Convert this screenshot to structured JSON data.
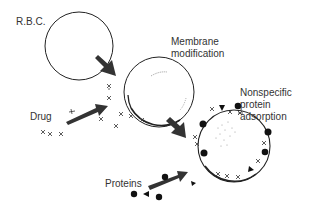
{
  "diagram": {
    "labels": {
      "rbc": "R.B.C.",
      "membrane_line1": "Membrane",
      "membrane_line2": "modification",
      "nonspecific_line1": "Nonspecific",
      "nonspecific_line2": "protein",
      "nonspecific_line3": "adsorption",
      "drug": "Drug",
      "proteins": "Proteins"
    },
    "stages": [
      {
        "name": "rbc",
        "cx": 79,
        "cy": 46,
        "r": 34
      },
      {
        "name": "membrane-modified-cell",
        "cx": 159,
        "cy": 92,
        "r": 35
      },
      {
        "name": "protein-adsorbed-cell",
        "cx": 234,
        "cy": 146,
        "r": 36
      }
    ],
    "colors": {
      "stroke": "#222222",
      "arrow": "#333333",
      "text": "#333333",
      "background": "#ffffff"
    }
  }
}
